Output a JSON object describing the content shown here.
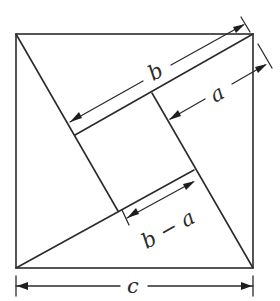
{
  "diagram": {
    "colors": {
      "stroke": "#2b2b2b",
      "background": "#ffffff"
    },
    "outer_square": {
      "top_left": [
        16,
        34
      ],
      "top_right": [
        253,
        34
      ],
      "bottom_right": [
        253,
        268
      ],
      "bottom_left": [
        16,
        268
      ]
    },
    "inner_square": {
      "top_left": [
        75,
        135
      ],
      "top_right": [
        152,
        93
      ],
      "bottom_right": [
        194,
        170
      ],
      "bottom_left": [
        118,
        211
      ]
    },
    "labels": {
      "b": "b",
      "a": "a",
      "b_minus_a": "b − a",
      "c": "c"
    },
    "dimensions": [
      {
        "name": "b",
        "label": "b",
        "from": [
          70,
          122
        ],
        "to": [
          243,
          25
        ]
      },
      {
        "name": "a",
        "label": "a",
        "from": [
          170,
          119
        ],
        "to": [
          265,
          65
        ]
      },
      {
        "name": "b-minus-a",
        "label": "b − a",
        "from": [
          127,
          218
        ],
        "to": [
          193,
          182
        ]
      },
      {
        "name": "c",
        "label": "c",
        "from": [
          16,
          286
        ],
        "to": [
          253,
          286
        ]
      }
    ]
  }
}
